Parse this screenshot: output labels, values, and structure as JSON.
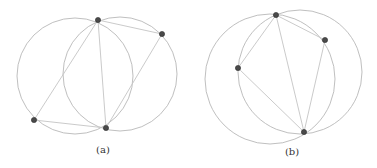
{
  "figures": [
    {
      "label": "(a)",
      "label_pos": [
        103,
        153
      ],
      "circles": [
        {
          "cx": 75,
          "cy": 76,
          "r": 58
        },
        {
          "cx": 120,
          "cy": 74,
          "r": 57
        }
      ],
      "points": [
        {
          "name": "top",
          "x": 98,
          "y": 20
        },
        {
          "name": "right",
          "x": 162,
          "y": 34
        },
        {
          "name": "left",
          "x": 34,
          "y": 120
        },
        {
          "name": "bottom",
          "x": 106,
          "y": 128
        }
      ],
      "edges": [
        [
          "top",
          "right"
        ],
        [
          "top",
          "left"
        ],
        [
          "top",
          "bottom"
        ],
        [
          "right",
          "bottom"
        ],
        [
          "left",
          "bottom"
        ]
      ]
    },
    {
      "label": "(b)",
      "label_pos": [
        292,
        155
      ],
      "circles": [
        {
          "cx": 270,
          "cy": 79,
          "r": 65
        },
        {
          "cx": 300,
          "cy": 72,
          "r": 62
        }
      ],
      "points": [
        {
          "name": "top",
          "x": 276,
          "y": 15
        },
        {
          "name": "right",
          "x": 325,
          "y": 40
        },
        {
          "name": "left",
          "x": 238,
          "y": 68
        },
        {
          "name": "bottom",
          "x": 304,
          "y": 132
        }
      ],
      "edges": [
        [
          "top",
          "right"
        ],
        [
          "top",
          "left"
        ],
        [
          "top",
          "bottom"
        ],
        [
          "right",
          "bottom"
        ],
        [
          "left",
          "bottom"
        ]
      ]
    }
  ],
  "colors": {
    "circle": "#b8b8b8",
    "edge": "#c4c4c4",
    "point": "#4a4a4a",
    "label": "#333333"
  }
}
